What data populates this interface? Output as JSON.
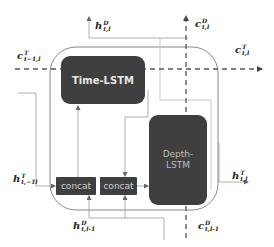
{
  "diagram": {
    "type": "LSTM cell block diagram",
    "colors": {
      "block_fill": "#3f3f3f",
      "line": "#9a9a9a",
      "dashed": "#555555",
      "outer_border": "#8a8a8a"
    },
    "blocks": {
      "time_lstm": {
        "label": "Time-LSTM"
      },
      "depth_lstm": {
        "line1": "Depth-",
        "line2": "LSTM"
      },
      "concat_left": {
        "label": "concat"
      },
      "concat_right": {
        "label": "concat"
      }
    },
    "labels": {
      "h_D_out": {
        "base": "h",
        "sup": "D",
        "sub": "t,l"
      },
      "c_D_out": {
        "base": "c",
        "sup": "D",
        "sub": "t,l"
      },
      "c_T_in": {
        "base": "c",
        "sup": "T",
        "sub": "t−1,l"
      },
      "c_T_out": {
        "base": "c",
        "sup": "T",
        "sub": "t,l"
      },
      "h_T_in": {
        "base": "h",
        "sup": "T",
        "sub": "t,−1l"
      },
      "h_T_out": {
        "base": "h",
        "sup": "T",
        "sub": "t,l"
      },
      "h_D_in": {
        "base": "h",
        "sup": "D",
        "sub": "t,l-1"
      },
      "c_D_in": {
        "base": "c",
        "sup": "D",
        "sub": "t,l-1"
      }
    }
  }
}
